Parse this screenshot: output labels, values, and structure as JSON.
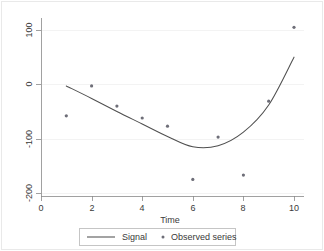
{
  "chart_data": {
    "type": "line",
    "title": "",
    "subtitle": "",
    "xlabel": "Time",
    "ylabel": "",
    "xlim": [
      0,
      10.6
    ],
    "ylim": [
      -215,
      118
    ],
    "xticks": [
      0,
      2,
      4,
      6,
      8,
      10
    ],
    "xtick_labels": [
      "0",
      "2",
      "4",
      "6",
      "8",
      "10"
    ],
    "yticks": [
      100,
      0,
      -100,
      -200
    ],
    "ytick_labels": [
      "100",
      "0",
      "-100",
      "-200"
    ],
    "grid": "horizontal-faint",
    "legend_position": "below-center",
    "series": [
      {
        "name": "Signal",
        "type": "line",
        "color": "#4f4f4f",
        "x": [
          1,
          2,
          3,
          4,
          5,
          6,
          7,
          8,
          9,
          10
        ],
        "values": [
          -3,
          -26,
          -50,
          -73,
          -96,
          -115,
          -113,
          -88,
          -38,
          50
        ]
      },
      {
        "name": "Observed series",
        "type": "scatter",
        "color": "#6e6e78",
        "x": [
          1,
          2,
          3,
          4,
          5,
          6,
          7,
          8,
          9,
          10
        ],
        "values": [
          -58,
          -3,
          -40,
          -62,
          -77,
          -175,
          -97,
          -167,
          -31,
          105
        ]
      }
    ]
  },
  "legend": {
    "entries": [
      {
        "label": "Signal",
        "marker": "line"
      },
      {
        "label": "Observed series",
        "marker": "dot"
      }
    ]
  },
  "axes": {
    "x_title": "Time",
    "y_title": ""
  }
}
